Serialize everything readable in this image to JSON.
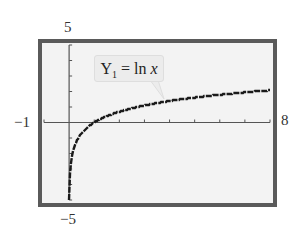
{
  "chart_data": {
    "type": "line",
    "title": "",
    "series": [
      {
        "name": "Y1 = ln x",
        "function": "ln(x)",
        "x_range": [
          0.05,
          8
        ]
      }
    ],
    "annotations": [
      {
        "text": "Y1 = ln x",
        "points_to": [
          3.8,
          1.3
        ]
      }
    ],
    "window": {
      "xmin": -1,
      "xmax": 8,
      "ymin": -5,
      "ymax": 5,
      "xscl": 1,
      "yscl": 1
    },
    "xlim": [
      -1,
      8
    ],
    "ylim": [
      -5,
      5
    ],
    "xlabel": "",
    "ylabel": "",
    "grid": false,
    "legend": "none"
  },
  "labels": {
    "ymax": "5",
    "ymin": "−5",
    "xmin": "−1",
    "xmax": "8",
    "callout_main": "Y",
    "callout_sub": "1",
    "callout_rest": " = ln ",
    "callout_var": "x"
  },
  "colors": {
    "frame": "#5a5a5a",
    "screen": "#f3f3f3",
    "curve": "#1a1a1a",
    "axis": "#555555"
  }
}
